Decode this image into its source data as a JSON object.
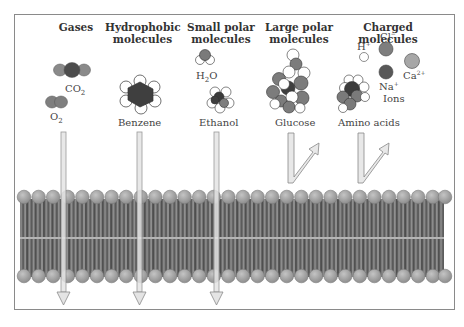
{
  "figure": {
    "categories": [
      {
        "id": "gases",
        "header": "Gases",
        "molecules": [
          "CO2",
          "O2"
        ],
        "crosses": true
      },
      {
        "id": "hydrophobic",
        "header_line1": "Hydrophobic",
        "header_line2": "molecules",
        "molecules": [
          "Benzene"
        ],
        "crosses": true
      },
      {
        "id": "small-polar",
        "header_line1": "Small polar",
        "header_line2": "molecules",
        "molecules": [
          "H2O",
          "Ethanol"
        ],
        "crosses": true
      },
      {
        "id": "large-polar",
        "header_line1": "Large polar",
        "header_line2": "molecules",
        "molecules": [
          "Glucose"
        ],
        "crosses": false
      },
      {
        "id": "charged",
        "header": "Charged molecules",
        "molecules": [
          "Amino acids"
        ],
        "ions": [
          "H+",
          "Cl−",
          "Na+",
          "Ca2+"
        ],
        "ions_label": "Ions",
        "crosses": false
      }
    ]
  },
  "labels": {
    "gases": "Gases",
    "hydrophobic_1": "Hydrophobic",
    "hydrophobic_2": "molecules",
    "small_polar_1": "Small polar",
    "small_polar_2": "molecules",
    "large_polar_1": "Large polar",
    "large_polar_2": "molecules",
    "charged": "Charged molecules",
    "co2": "CO",
    "co2_sub": "2",
    "o2": "O",
    "o2_sub": "2",
    "h2o_h": "H",
    "h2o_sub": "2",
    "h2o_o": "O",
    "benzene": "Benzene",
    "ethanol": "Ethanol",
    "glucose": "Glucose",
    "amino_acids": "Amino acids",
    "h_ion": "H",
    "h_ion_sup": "+",
    "cl_ion": "Cl",
    "cl_ion_sup": "−",
    "na_ion": "Na",
    "na_ion_sup": "+",
    "ca_ion": "Ca",
    "ca_ion_sup": "2+",
    "ions": "Ions"
  },
  "colors": {
    "head": "#a9a9a9",
    "tail_dark": "#555555",
    "tail_light": "#9a9a9a",
    "arrow_fill": "#e2e2e2",
    "arrow_stroke": "#888888",
    "atom_dark": "#4a4a4a",
    "atom_mid": "#7d7d7d",
    "atom_light": "#a8a8a8"
  }
}
